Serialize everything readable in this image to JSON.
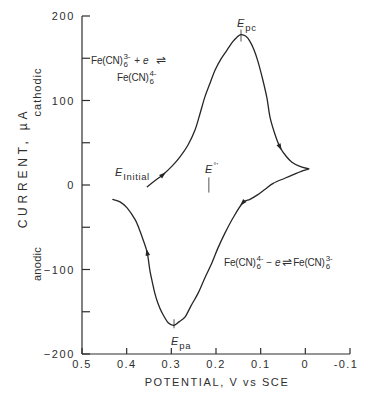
{
  "chart_data": {
    "type": "line",
    "title": "",
    "xlabel": "POTENTIAL, V vs SCE",
    "ylabel": "CURRENT, µA",
    "xlim": [
      0.5,
      -0.1
    ],
    "ylim": [
      -200,
      200
    ],
    "x_ticks": [
      0.5,
      0.4,
      0.3,
      0.2,
      0.1,
      0,
      -0.1
    ],
    "x_tick_labels": [
      "0.5",
      "0.4",
      "0.3",
      "0.2",
      "0.1",
      "0",
      "-0.1"
    ],
    "y_ticks": [
      200,
      100,
      0,
      -100,
      -200
    ],
    "y_tick_labels": [
      "200",
      "100",
      "0",
      "−100",
      "−200"
    ],
    "y_minor_ticks": [
      150,
      50,
      -50,
      -150
    ],
    "grid": false,
    "legend": null,
    "y_region_labels": {
      "positive": "cathodic",
      "negative": "anodic"
    },
    "series": [
      {
        "name": "Cyclic voltammogram of Fe(CN)6 3-/4-",
        "color": "#262626",
        "cusp_index": 28,
        "points": [
          [
            0.354,
            -2
          ],
          [
            0.337,
            5
          ],
          [
            0.319,
            12
          ],
          [
            0.299,
            22
          ],
          [
            0.281,
            33
          ],
          [
            0.263,
            47
          ],
          [
            0.247,
            65
          ],
          [
            0.236,
            84
          ],
          [
            0.225,
            104
          ],
          [
            0.213,
            121
          ],
          [
            0.202,
            136
          ],
          [
            0.189,
            149
          ],
          [
            0.175,
            160
          ],
          [
            0.162,
            170
          ],
          [
            0.153,
            175
          ],
          [
            0.144,
            178
          ],
          [
            0.133,
            176
          ],
          [
            0.124,
            170
          ],
          [
            0.115,
            160
          ],
          [
            0.106,
            146
          ],
          [
            0.095,
            124
          ],
          [
            0.086,
            103
          ],
          [
            0.079,
            80
          ],
          [
            0.068,
            60
          ],
          [
            0.057,
            45
          ],
          [
            0.043,
            34
          ],
          [
            0.03,
            27
          ],
          [
            0.012,
            22
          ],
          [
            -0.008,
            19
          ],
          [
            0.005,
            17
          ],
          [
            0.019,
            14
          ],
          [
            0.046,
            8
          ],
          [
            0.072,
            2
          ],
          [
            0.09,
            -5
          ],
          [
            0.108,
            -12
          ],
          [
            0.124,
            -17
          ],
          [
            0.14,
            -21
          ],
          [
            0.162,
            -39
          ],
          [
            0.18,
            -57
          ],
          [
            0.196,
            -75
          ],
          [
            0.209,
            -92
          ],
          [
            0.225,
            -110
          ],
          [
            0.24,
            -128
          ],
          [
            0.256,
            -143
          ],
          [
            0.269,
            -156
          ],
          [
            0.283,
            -162
          ],
          [
            0.294,
            -166
          ],
          [
            0.307,
            -163
          ],
          [
            0.321,
            -151
          ],
          [
            0.33,
            -140
          ],
          [
            0.337,
            -128
          ],
          [
            0.343,
            -114
          ],
          [
            0.348,
            -101
          ],
          [
            0.354,
            -80
          ],
          [
            0.363,
            -65
          ],
          [
            0.372,
            -52
          ],
          [
            0.381,
            -41
          ],
          [
            0.399,
            -27
          ],
          [
            0.415,
            -20
          ],
          [
            0.431,
            -17
          ]
        ]
      }
    ],
    "direction_arrows": [
      2,
      24,
      36,
      53
    ],
    "markers": [
      {
        "name": "E_pc",
        "E": 0.144,
        "I": 178
      },
      {
        "name": "E_pa",
        "E": 0.294,
        "I": -166
      },
      {
        "name": "E_formal",
        "E": 0.216,
        "I_range": [
          9,
          -9
        ]
      },
      {
        "name": "E_Initial",
        "E": 0.354,
        "I": -2
      }
    ]
  },
  "annotations": {
    "forward_reaction": {
      "reactant_formula": "Fe(CN)",
      "reactant_sub": "6",
      "reactant_charge": "3-",
      "operator": "+",
      "electron": "e",
      "equilibrium": "⇌",
      "product_formula": "Fe(CN)",
      "product_sub": "6",
      "product_charge": "4-"
    },
    "reverse_reaction": {
      "reactant_formula": "Fe(CN)",
      "reactant_sub": "6",
      "reactant_charge": "4-",
      "operator": "−",
      "electron": "e",
      "equilibrium": "⇌",
      "product_formula": "Fe(CN)",
      "product_sub": "6",
      "product_charge": "3-"
    },
    "e_initial": {
      "symbol": "E",
      "subscript": "Initial"
    },
    "e_pc": {
      "symbol": "E",
      "subscript": "pc"
    },
    "e_pa": {
      "symbol": "E",
      "subscript": "pa"
    },
    "e_formal": {
      "symbol": "E",
      "superscript": "°'"
    }
  }
}
